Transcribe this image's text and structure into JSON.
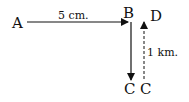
{
  "diagram": {
    "points": {
      "A": "A",
      "B": "B",
      "C1": "C",
      "C2": "C",
      "D": "D"
    },
    "edges": [
      {
        "from": "A",
        "to": "B",
        "label": "5 cm.",
        "style": "solid"
      },
      {
        "from": "B",
        "to": "C",
        "label": "",
        "style": "solid"
      },
      {
        "from": "C",
        "to": "D",
        "label": "1 km.",
        "style": "dashed"
      }
    ],
    "colors": {
      "stroke": "#111111",
      "background": "#ffffff"
    }
  }
}
